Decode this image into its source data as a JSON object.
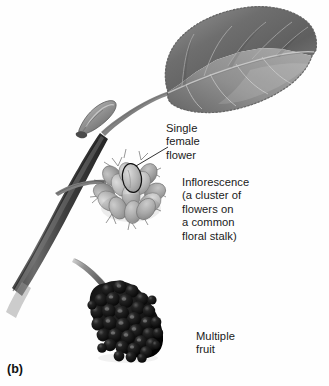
{
  "figure": {
    "panel_letter": "(b)",
    "background_color": "#fefefe",
    "ink_color": "#1a1a1a"
  },
  "labels": {
    "single_female_flower": "Single\nfemale\nflower",
    "inflorescence": "Inflorescence\n(a cluster of\nflowers on\na common\nfloral stalk)",
    "multiple_fruit": "Multiple\nfruit"
  },
  "parts": {
    "leaf": {
      "name": "leaf",
      "description": "ovate serrated leaf with midrib and lateral veins",
      "fill_dark": "#6f6f6f",
      "fill_light": "#a9a9a9"
    },
    "petiole": {
      "name": "petiole",
      "color": "#8a8a8a"
    },
    "bud": {
      "name": "terminal-bud",
      "color": "#9a9a9a"
    },
    "stem": {
      "name": "woody-stem",
      "color": "#4a4a4a"
    },
    "inflorescence": {
      "name": "inflorescence-cluster",
      "floret_count": 14,
      "floret_fill": "#b8b8b8",
      "style_hairs": true
    },
    "circled_flower": {
      "name": "single-female-flower-highlight",
      "outline_color": "#111111"
    },
    "fruit": {
      "name": "multiple-fruit",
      "drupelet_count": 38,
      "fill": "#0d0d0d",
      "highlight": "#5a5a5a"
    }
  }
}
